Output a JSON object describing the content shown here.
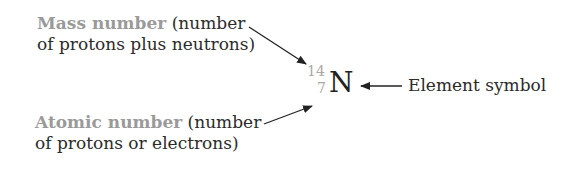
{
  "diagram": {
    "mass_label": {
      "highlight": "Mass number",
      "line1_rest": " (number",
      "line2": "of protons plus neutrons)"
    },
    "atomic_label": {
      "highlight": "Atomic number",
      "line1_rest": " (number",
      "line2": "of protons or electrons)"
    },
    "element_label": "Element symbol",
    "nuclide": {
      "mass_number": "14",
      "atomic_number": "7",
      "symbol": "N"
    },
    "colors": {
      "highlight": "#9a9a9a",
      "text": "#2b2b2b",
      "arrow": "#222222"
    }
  }
}
